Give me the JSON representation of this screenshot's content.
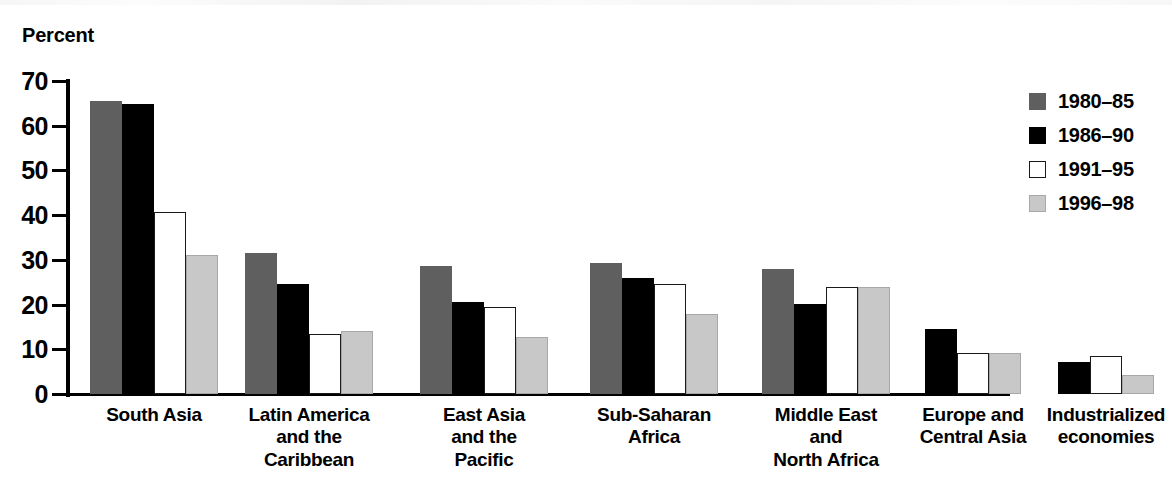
{
  "chart_data": {
    "type": "bar",
    "title": "",
    "xlabel": "",
    "ylabel": "Percent",
    "ylim": [
      0,
      70
    ],
    "yticks": [
      0,
      10,
      20,
      30,
      40,
      50,
      60,
      70
    ],
    "ytick_labels": [
      "0",
      "10",
      "20",
      "30",
      "40",
      "50",
      "60",
      "70"
    ],
    "grid": false,
    "legend_position": "right",
    "categories": [
      "South Asia",
      "Latin America and the Caribbean",
      "East Asia and the Pacific",
      "Sub-Saharan Africa",
      "Middle East and North Africa",
      "Europe and Central Asia",
      "Industrialized economies"
    ],
    "category_label_lines": [
      [
        "South Asia"
      ],
      [
        "Latin America",
        "and the",
        "Caribbean"
      ],
      [
        "East Asia",
        "and the",
        "Pacific"
      ],
      [
        "Sub-Saharan",
        "Africa"
      ],
      [
        "Middle East",
        "and",
        "North Africa"
      ],
      [
        "Europe and",
        "Central Asia"
      ],
      [
        "Industrialized",
        "economies"
      ]
    ],
    "series": [
      {
        "name": "1980–85",
        "color": "#5f5f5f",
        "values": [
          65.5,
          31.5,
          28.7,
          29.4,
          27.9,
          null,
          null
        ]
      },
      {
        "name": "1986–90",
        "color": "#000000",
        "values": [
          64.8,
          24.6,
          20.6,
          26.0,
          20.2,
          14.6,
          7.2
        ]
      },
      {
        "name": "1991–95",
        "color": "#ffffff",
        "values": [
          40.8,
          13.4,
          19.4,
          24.7,
          23.9,
          9.1,
          8.6
        ]
      },
      {
        "name": "1996–98",
        "color": "#c8c8c8",
        "values": [
          31.2,
          14.0,
          12.8,
          17.8,
          23.9,
          9.2,
          4.3
        ]
      }
    ]
  },
  "legend": {
    "items": [
      {
        "label": "1980–85"
      },
      {
        "label": "1986–90"
      },
      {
        "label": "1991–95"
      },
      {
        "label": "1996–98"
      }
    ]
  },
  "axis": {
    "y_title": "Percent"
  }
}
